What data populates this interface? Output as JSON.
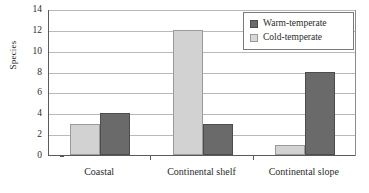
{
  "chart_data": {
    "type": "bar",
    "title": "",
    "xlabel": "",
    "ylabel": "Species",
    "ylim": [
      0,
      14
    ],
    "ytick_step": 2,
    "yticks": [
      0,
      2,
      4,
      6,
      8,
      10,
      12,
      14
    ],
    "grid": true,
    "legend_position": "top-right",
    "categories": [
      "Coastal",
      "Continental shelf",
      "Continental slope"
    ],
    "series": [
      {
        "name": "Warm-temperate",
        "color": "#6a6a6a",
        "values": [
          4,
          3,
          8
        ]
      },
      {
        "name": "Cold-temperate",
        "color": "#d2d2d2",
        "values": [
          3,
          12,
          1
        ]
      }
    ],
    "series_draw_order": [
      "Cold-temperate",
      "Warm-temperate"
    ]
  },
  "legend": {
    "entries": [
      {
        "label": "Warm-temperate"
      },
      {
        "label": "Cold-temperate"
      }
    ]
  },
  "axes": {
    "y_title": "Species",
    "y_tick_labels": [
      "14",
      "12",
      "10",
      "8",
      "6",
      "4",
      "2",
      "0"
    ],
    "x_tick_labels": [
      "Coastal",
      "Continental shelf",
      "Continental slope"
    ]
  }
}
